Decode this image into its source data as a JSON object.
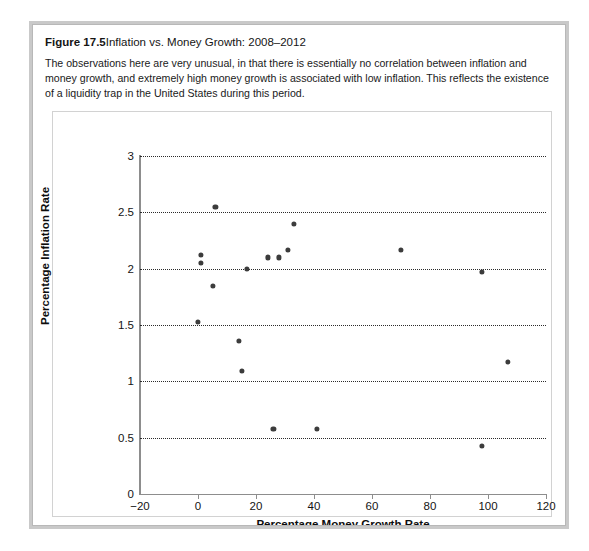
{
  "figure": {
    "label": "Figure 17.5",
    "title": "Inflation vs. Money Growth: 2008–2012",
    "description": "The observations here are very unusual, in that there is essentially no correlation between inflation and money growth, and extremely high money growth is associated with low inflation. This reflects the existence of a liquidity trap in the United States during this period."
  },
  "chart_data": {
    "type": "scatter",
    "title": "Inflation vs. Money Growth: 2008–2012",
    "xlabel": "Percentage Money Growth Rate",
    "ylabel": "Percentage Inflation Rate",
    "xlim": [
      -20,
      120
    ],
    "ylim": [
      0,
      3
    ],
    "xticks": [
      -20,
      0,
      20,
      40,
      60,
      80,
      100,
      120
    ],
    "xtick_labels": [
      "−20",
      "0",
      "20",
      "40",
      "60",
      "80",
      "100",
      "120"
    ],
    "yticks": [
      0,
      0.5,
      1,
      1.5,
      2,
      2.5,
      3
    ],
    "ytick_labels": [
      "0",
      "0.5",
      "1",
      "1.5",
      "2",
      "2.5",
      "3"
    ],
    "grid": "horizontal-dotted",
    "legend": null,
    "marker": {
      "shape": "circle",
      "color": "#3c3c3c",
      "size": 5
    },
    "points": [
      {
        "x": 6,
        "y": 2.55
      },
      {
        "x": 33,
        "y": 2.4
      },
      {
        "x": 1,
        "y": 2.12
      },
      {
        "x": 1,
        "y": 2.05
      },
      {
        "x": 31,
        "y": 2.17
      },
      {
        "x": 70,
        "y": 2.17
      },
      {
        "x": 24,
        "y": 2.1
      },
      {
        "x": 28,
        "y": 2.1
      },
      {
        "x": 17,
        "y": 2.0
      },
      {
        "x": 98,
        "y": 1.97
      },
      {
        "x": 5,
        "y": 1.85
      },
      {
        "x": 0,
        "y": 1.53
      },
      {
        "x": 14,
        "y": 1.36
      },
      {
        "x": 107,
        "y": 1.17
      },
      {
        "x": 15,
        "y": 1.09
      },
      {
        "x": 26,
        "y": 0.58
      },
      {
        "x": 41,
        "y": 0.58
      },
      {
        "x": 98,
        "y": 0.43
      }
    ]
  },
  "colors": {
    "frame": "#c9c9c9",
    "panel": "#ffffff",
    "axis": "#8d8d8d",
    "grid": "#2b2b2b",
    "marker": "#3c3c3c",
    "text": "#141414"
  }
}
